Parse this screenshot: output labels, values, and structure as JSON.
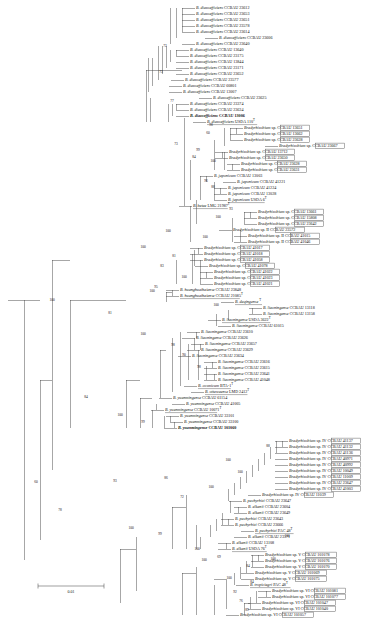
{
  "figure": {
    "kind": "phylogenetic-tree",
    "scale_bar": {
      "label": "0.01",
      "x1": 38,
      "x2": 104,
      "y": 586
    }
  },
  "chart_data": {
    "type": "tree",
    "title": "",
    "xlabel": "",
    "ylabel": "",
    "scale": "0.01",
    "leaf_count": 121,
    "tip_label_font_size_px": 4.1,
    "groups": [
      "I",
      "II",
      "IV",
      "V",
      "VI",
      "VII"
    ],
    "leaves": [
      {
        "y": 8,
        "x": 196,
        "italic": "B. diazoefficiens",
        "plain": "CCBAU 23612"
      },
      {
        "y": 14,
        "x": 196,
        "italic": "B. diazoefficiens",
        "plain": "CCBAU 23653"
      },
      {
        "y": 20,
        "x": 196,
        "italic": "B. diazoefficiens",
        "plain": "CCBAU 23651"
      },
      {
        "y": 26,
        "x": 196,
        "italic": "B. diazoefficiens",
        "plain": "CCBAU 23578"
      },
      {
        "y": 32,
        "x": 196,
        "italic": "B. diazoefficiens",
        "plain": "CCBAU 23614"
      },
      {
        "y": 38,
        "x": 219,
        "italic": "B. diazoefficiens",
        "plain": "CCBAU 23606"
      },
      {
        "y": 44,
        "x": 196,
        "italic": "B. diazoefficiens",
        "plain": "CCBAU 23640"
      },
      {
        "y": 50,
        "x": 190,
        "italic": "B. diazoefficiens",
        "plain": "CCBAU 13640"
      },
      {
        "y": 56,
        "x": 190,
        "italic": "B. diazoefficiens",
        "plain": "CCBAU 23175"
      },
      {
        "y": 62,
        "x": 190,
        "italic": "B. diazoefficiens",
        "plain": "CCBAU 13844"
      },
      {
        "y": 68,
        "x": 190,
        "italic": "B. diazoefficiens",
        "plain": "CCBAU 23171"
      },
      {
        "y": 74,
        "x": 190,
        "italic": "B. diazoefficiens",
        "plain": "CCBAU 23652"
      },
      {
        "y": 80,
        "x": 185,
        "italic": "B. diazoefficiens",
        "plain": "CCBAU 23577"
      },
      {
        "y": 86,
        "x": 183,
        "italic": "B. diazoefficiens",
        "plain": "CCBAU 60801"
      },
      {
        "y": 92,
        "x": 183,
        "italic": "B. diazoefficiens",
        "plain": "CCBAU 13007"
      },
      {
        "y": 98,
        "x": 213,
        "italic": "B. diazoefficiens",
        "plain": "CCBAU 23625"
      },
      {
        "y": 104,
        "x": 190,
        "italic": "B. diazoefficiens",
        "plain": "CCBAU 23374"
      },
      {
        "y": 110,
        "x": 190,
        "italic": "B. diazoefficiens",
        "plain": "CCBAU 23634"
      },
      {
        "y": 116,
        "x": 190,
        "italic": "B. diazoefficiens",
        "plain": "CCBAU 13006",
        "bold": true
      },
      {
        "y": 122,
        "x": 207,
        "italic": "B. diazoefficiens",
        "plain": "USDA 110",
        "underline": true,
        "sup": "T"
      },
      {
        "y": 128,
        "x": 244,
        "italic": "Bradyrhizobium",
        "plain": "sp.",
        "box": "CCBAU 13651"
      },
      {
        "y": 134,
        "x": 244,
        "italic": "Bradyrhizobium",
        "plain": "sp.",
        "box": "CCBAU 13662"
      },
      {
        "y": 140,
        "x": 244,
        "italic": "Bradyrhizobium",
        "plain": "sp.",
        "box": "CCBAU 23628"
      },
      {
        "y": 146,
        "x": 279,
        "italic": "Bradyrhizobium",
        "plain": "sp.",
        "box": "CCBAU 23667"
      },
      {
        "y": 152,
        "x": 229,
        "italic": "Bradyrhizobium",
        "plain": "sp.",
        "box": "CCBAU 13712"
      },
      {
        "y": 158,
        "x": 229,
        "italic": "Bradyrhizobium",
        "plain": "sp.",
        "box": "CCBAU 23650"
      },
      {
        "y": 164,
        "x": 241,
        "italic": "Bradyrhizobium",
        "plain": "sp.",
        "box": "CCBAU 23628"
      },
      {
        "y": 170,
        "x": 241,
        "italic": "Bradyrhizobium",
        "plain": "sp.",
        "box": "CCBAU 23631"
      },
      {
        "y": 176,
        "x": 214,
        "italic": "B. japonicum",
        "plain": "CCBAU 13003"
      },
      {
        "y": 182,
        "x": 237,
        "italic": "B. japonicum",
        "plain": "CCBAU 41221"
      },
      {
        "y": 188,
        "x": 228,
        "italic": "B. japonicum",
        "plain": "CCBAU 41224"
      },
      {
        "y": 194,
        "x": 228,
        "italic": "B. japonicum",
        "plain": "CCBAU 13028"
      },
      {
        "y": 200,
        "x": 228,
        "italic": "B. japonicum",
        "plain": "USDA 6",
        "underline": true,
        "sup": "T"
      },
      {
        "y": 206,
        "x": 193,
        "italic": "B. betae",
        "plain": "LMG 21987",
        "underline": true,
        "sup": "T"
      },
      {
        "y": 212,
        "x": 258,
        "italic": "Bradyrhizobium",
        "plain": "sp.",
        "box": "CCBAU 13661"
      },
      {
        "y": 218,
        "x": 258,
        "italic": "Bradyrhizobium",
        "plain": "sp.",
        "box": "CCBAU 15808"
      },
      {
        "y": 224,
        "x": 258,
        "italic": "Bradyrhizobium",
        "plain": "sp.",
        "box": "CCBAU 23642"
      },
      {
        "y": 230,
        "x": 233,
        "italic": "Bradyrhizobium",
        "plain": "sp. II",
        "box": "CCBAU 23572"
      },
      {
        "y": 236,
        "x": 248,
        "italic": "Bradyrhizobium",
        "plain": "sp. II",
        "box": "CCBAU 41015"
      },
      {
        "y": 242,
        "x": 248,
        "italic": "Bradyrhizobium",
        "plain": "sp. II",
        "box": "CCBAU 41046"
      },
      {
        "y": 248,
        "x": 204,
        "italic": "Bradyrhizobium",
        "plain": "sp.",
        "box": "CCBAU 41017"
      },
      {
        "y": 254,
        "x": 204,
        "italic": "Bradyrhizobium",
        "plain": "sp.",
        "box": "CCBAU 41018"
      },
      {
        "y": 260,
        "x": 204,
        "italic": "Bradyrhizobium",
        "plain": "sp.",
        "box": "CCBAU 41058"
      },
      {
        "y": 266,
        "x": 209,
        "italic": "Bradyrhizobium",
        "plain": "sp.",
        "box": "CCBAU 41078"
      },
      {
        "y": 272,
        "x": 214,
        "italic": "Bradyrhizobium",
        "plain": "sp.",
        "box": "CCBAU 41022"
      },
      {
        "y": 278,
        "x": 214,
        "italic": "Bradyrhizobium",
        "plain": "sp.",
        "box": "CCBAU 41023"
      },
      {
        "y": 284,
        "x": 214,
        "italic": "Bradyrhizobium",
        "plain": "sp.",
        "box": "CCBAU 41021"
      },
      {
        "y": 290,
        "x": 180,
        "italic": "B. huanghuaihaiense",
        "plain": "CCBAU 23848"
      },
      {
        "y": 296,
        "x": 180,
        "italic": "B. huanghuaihaiense",
        "plain": "CCBAU 21085",
        "underline": true,
        "sup": "T"
      },
      {
        "y": 302,
        "x": 235,
        "italic": "B. daqingense",
        "plain": "",
        "underline": true,
        "sup": "T"
      },
      {
        "y": 308,
        "x": 263,
        "italic": "B. liaoningense",
        "plain": "CCBAU 13118"
      },
      {
        "y": 314,
        "x": 263,
        "italic": "B. liaoningense",
        "plain": "CCBAU 13158"
      },
      {
        "y": 320,
        "x": 222,
        "italic": "B. liaoningense",
        "plain": "USDA 3622",
        "underline": true,
        "sup": "T"
      },
      {
        "y": 326,
        "x": 232,
        "italic": "B. liaoningense",
        "plain": "CCBAU 61015"
      },
      {
        "y": 332,
        "x": 201,
        "italic": "B. liaoningense",
        "plain": "CCBAU 23610"
      },
      {
        "y": 338,
        "x": 196,
        "italic": "B. liaoningense",
        "plain": "CCBAU 23626"
      },
      {
        "y": 344,
        "x": 205,
        "italic": "B. liaoningense",
        "plain": "CCBAU 23657"
      },
      {
        "y": 350,
        "x": 201,
        "italic": "B. liaoningense",
        "plain": "CCBAU 23629"
      },
      {
        "y": 356,
        "x": 192,
        "italic": "B. liaoningense",
        "plain": "CCBAU 23634"
      },
      {
        "y": 362,
        "x": 218,
        "italic": "B. liaoningense",
        "plain": "CCBAU 23616"
      },
      {
        "y": 368,
        "x": 218,
        "italic": "B. liaoningense",
        "plain": "CCBAU 23615"
      },
      {
        "y": 374,
        "x": 218,
        "italic": "B. liaoningense",
        "plain": "CCBAU 23641"
      },
      {
        "y": 380,
        "x": 218,
        "italic": "B. liaoningense",
        "plain": "CCBAU 41048"
      },
      {
        "y": 386,
        "x": 198,
        "italic": "B. cosmicum",
        "plain": "BTA-1",
        "underline": true,
        "sup": "T"
      },
      {
        "y": 392,
        "x": 205,
        "italic": "B. ottawaense",
        "plain": "LMD 2412",
        "underline": true,
        "sup": "T"
      },
      {
        "y": 398,
        "x": 173,
        "italic": "B. yuanmingense",
        "plain": "CCBAU 61154"
      },
      {
        "y": 404,
        "x": 186,
        "italic": "B. yuanmingense",
        "plain": "CCBAU 41005"
      },
      {
        "y": 410,
        "x": 165,
        "italic": "B. yuanmingense",
        "plain": "CCBAU 10071",
        "underline": true,
        "sup": "T"
      },
      {
        "y": 416,
        "x": 180,
        "italic": "B. yuanmingense",
        "plain": "CCBAU 33101"
      },
      {
        "y": 422,
        "x": 184,
        "italic": "B. yuanmingense",
        "plain": "CCBAU 33100"
      },
      {
        "y": 428,
        "x": 178,
        "italic": "B. yuanmingense",
        "plain": "CCBAU 101060",
        "bold": true
      },
      {
        "y": 441,
        "x": 289,
        "italic": "Bradyrhizobium",
        "plain": "sp. IV",
        "box": "CCBAU 41137"
      },
      {
        "y": 447,
        "x": 289,
        "italic": "Bradyrhizobium",
        "plain": "sp. IV",
        "box": "CCBAU 41132"
      },
      {
        "y": 453,
        "x": 289,
        "italic": "Bradyrhizobium",
        "plain": "sp. IV",
        "box": "CCBAU 41136"
      },
      {
        "y": 459,
        "x": 289,
        "italic": "Bradyrhizobium",
        "plain": "sp. IV",
        "box": "CCBAU 40971"
      },
      {
        "y": 465,
        "x": 289,
        "italic": "Bradyrhizobium",
        "plain": "sp. IV",
        "box": "CCBAU 40992"
      },
      {
        "y": 471,
        "x": 289,
        "italic": "Bradyrhizobium",
        "plain": "sp. IV",
        "box": "CCBAU 10049"
      },
      {
        "y": 477,
        "x": 289,
        "italic": "Bradyrhizobium",
        "plain": "sp. IV",
        "box": "CCBAU 11009"
      },
      {
        "y": 483,
        "x": 289,
        "italic": "Bradyrhizobium",
        "plain": "sp. IV",
        "box": "CCBAU 23647"
      },
      {
        "y": 489,
        "x": 289,
        "italic": "Bradyrhizobium",
        "plain": "sp. IV",
        "box": "CCBAU 41003"
      },
      {
        "y": 495,
        "x": 262,
        "italic": "Bradyrhizobium",
        "plain": "sp. IV",
        "box": "CCBAU 11039"
      },
      {
        "y": 501,
        "x": 243,
        "italic": "B. pachyrhizi",
        "plain": "CCBAU 23647"
      },
      {
        "y": 507,
        "x": 248,
        "italic": "B. elkanii",
        "plain": "CCBAU 23604"
      },
      {
        "y": 513,
        "x": 248,
        "italic": "B. elkanii",
        "plain": "CCBAU 23649"
      },
      {
        "y": 519,
        "x": 235,
        "italic": "B. pachyrhizi",
        "plain": "CCBAU 23643"
      },
      {
        "y": 525,
        "x": 235,
        "italic": "B. pachyrhizi",
        "plain": "CCBAU 23666"
      },
      {
        "y": 531,
        "x": 255,
        "italic": "B. pachyrhizi",
        "plain": "PAC 48",
        "underline": true,
        "sup": "T"
      },
      {
        "y": 537,
        "x": 248,
        "italic": "B. elkanii",
        "plain": "CCBAU 23571"
      },
      {
        "y": 543,
        "x": 232,
        "italic": "B. elkanii",
        "plain": "CCBAU 13108"
      },
      {
        "y": 549,
        "x": 232,
        "italic": "B. elkanii",
        "plain": "USDA 76",
        "underline": true,
        "sup": "T"
      },
      {
        "y": 555,
        "x": 265,
        "italic": "Bradyrhizobium",
        "plain": "sp. V",
        "box": "CCBAU 101078"
      },
      {
        "y": 561,
        "x": 265,
        "italic": "Bradyrhizobium",
        "plain": "sp. V",
        "box": "CCBAU 101076"
      },
      {
        "y": 567,
        "x": 265,
        "italic": "Bradyrhizobium",
        "plain": "sp. V",
        "box": "CCBAU 101070"
      },
      {
        "y": 573,
        "x": 255,
        "italic": "Bradyrhizobium",
        "plain": "sp. V",
        "box": "CCBAU 101069"
      },
      {
        "y": 579,
        "x": 255,
        "italic": "Bradyrhizobium",
        "plain": "sp. V",
        "box": "CCBAU 101075"
      },
      {
        "y": 585,
        "x": 250,
        "italic": "B. tropiciagri",
        "plain": "PAC 48",
        "underline": true,
        "sup": "T"
      },
      {
        "y": 591,
        "x": 272,
        "italic": "Bradyrhizobium",
        "plain": "sp. VI",
        "box": "CCBAU 101081"
      },
      {
        "y": 597,
        "x": 272,
        "italic": "Bradyrhizobium",
        "plain": "sp. VI",
        "box": "CCBAU 101077"
      },
      {
        "y": 603,
        "x": 262,
        "italic": "Bradyrhizobium",
        "plain": "sp. VI",
        "box": "CCBAU 101047"
      },
      {
        "y": 609,
        "x": 262,
        "italic": "Bradyrhizobium",
        "plain": "sp. VI",
        "box": "CCBAU 101040"
      },
      {
        "y": 615,
        "x": 240,
        "italic": "Bradyrhizobium",
        "plain": "sp. VI",
        "box": "CCBAU 101057"
      }
    ]
  },
  "tree": {
    "tip_x_default": 196,
    "branch_color": "#3c3c3c",
    "bootstrap_values": [
      {
        "v": "72",
        "x": 165,
        "y": 46
      },
      {
        "v": "73",
        "x": 161,
        "y": 72
      },
      {
        "v": "77",
        "x": 172,
        "y": 101
      },
      {
        "v": "98",
        "x": 211,
        "y": 125
      },
      {
        "v": "60",
        "x": 208,
        "y": 133
      },
      {
        "v": "73",
        "x": 176,
        "y": 144
      },
      {
        "v": "99",
        "x": 198,
        "y": 150
      },
      {
        "v": "84",
        "x": 194,
        "y": 157
      },
      {
        "v": "100",
        "x": 213,
        "y": 161
      },
      {
        "v": "96",
        "x": 206,
        "y": 181
      },
      {
        "v": "88",
        "x": 213,
        "y": 187
      },
      {
        "v": "93",
        "x": 231,
        "y": 209
      },
      {
        "v": "100",
        "x": 218,
        "y": 217
      },
      {
        "v": "100",
        "x": 168,
        "y": 231
      },
      {
        "v": "100",
        "x": 205,
        "y": 237
      },
      {
        "v": "100",
        "x": 143,
        "y": 247
      },
      {
        "v": "81",
        "x": 174,
        "y": 256
      },
      {
        "v": "83",
        "x": 162,
        "y": 266
      },
      {
        "v": "100",
        "x": 184,
        "y": 277
      },
      {
        "v": "95",
        "x": 156,
        "y": 287
      },
      {
        "v": "100",
        "x": 152,
        "y": 291
      },
      {
        "v": "100",
        "x": 216,
        "y": 305
      },
      {
        "v": "81",
        "x": 110,
        "y": 313
      },
      {
        "v": "100",
        "x": 143,
        "y": 334
      },
      {
        "v": "98",
        "x": 173,
        "y": 345
      },
      {
        "v": "90",
        "x": 184,
        "y": 355
      },
      {
        "v": "98",
        "x": 199,
        "y": 367
      },
      {
        "v": "84",
        "x": 86,
        "y": 397
      },
      {
        "v": "100",
        "x": 120,
        "y": 415
      },
      {
        "v": "99",
        "x": 143,
        "y": 422
      },
      {
        "v": "88",
        "x": 268,
        "y": 446
      },
      {
        "v": "100",
        "x": 228,
        "y": 460
      },
      {
        "v": "100",
        "x": 240,
        "y": 472
      },
      {
        "v": "93",
        "x": 115,
        "y": 481
      },
      {
        "v": "86",
        "x": 166,
        "y": 478
      },
      {
        "v": "100",
        "x": 211,
        "y": 487
      },
      {
        "v": "72",
        "x": 182,
        "y": 497
      },
      {
        "v": "100",
        "x": 131,
        "y": 528
      },
      {
        "v": "99",
        "x": 160,
        "y": 534
      },
      {
        "v": "100",
        "x": 197,
        "y": 549
      },
      {
        "v": "69",
        "x": 219,
        "y": 557
      },
      {
        "v": "100",
        "x": 287,
        "y": 536
      },
      {
        "v": "60",
        "x": 36,
        "y": 482
      },
      {
        "v": "78",
        "x": 60,
        "y": 510
      },
      {
        "v": "100",
        "x": 204,
        "y": 560
      },
      {
        "v": "84",
        "x": 248,
        "y": 566
      },
      {
        "v": "100",
        "x": 273,
        "y": 559
      },
      {
        "v": "100",
        "x": 229,
        "y": 578
      },
      {
        "v": "84",
        "x": 252,
        "y": 582
      },
      {
        "v": "92",
        "x": 235,
        "y": 592
      },
      {
        "v": "76",
        "x": 241,
        "y": 601
      },
      {
        "v": "89",
        "x": 247,
        "y": 610
      },
      {
        "v": "100",
        "x": 52,
        "y": 300
      }
    ]
  }
}
